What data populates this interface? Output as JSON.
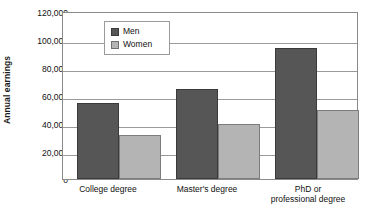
{
  "chart_data": {
    "type": "bar",
    "title": "",
    "xlabel": "",
    "ylabel": "Annual earnings",
    "categories": [
      "College degree",
      "Master's degree",
      "PhD or professional degree"
    ],
    "series": [
      {
        "name": "Men",
        "color": "#565656",
        "values": [
          55000,
          65000,
          95000
        ]
      },
      {
        "name": "Women",
        "color": "#b4b4b4",
        "values": [
          32000,
          40000,
          50000
        ]
      }
    ],
    "ylim": [
      0,
      120000
    ],
    "ytick_values": [
      0,
      20000,
      40000,
      60000,
      80000,
      100000,
      120000
    ],
    "ytick_labels": [
      "0",
      "20,000",
      "40,000",
      "60,000",
      "80,000",
      "100,000",
      "120,000"
    ],
    "grid": true,
    "legend_position": "top-center"
  },
  "legend": {
    "entries": [
      {
        "label": "Men",
        "swatch": "men-color-swatch"
      },
      {
        "label": "Women",
        "swatch": "women-color-swatch"
      }
    ]
  },
  "axis": {
    "y_title": "Annual earnings"
  },
  "xtick_lines": {
    "cat0": [
      "College degree"
    ],
    "cat1": [
      "Master's degree"
    ],
    "cat2": [
      "PhD or",
      "professional degree"
    ]
  }
}
